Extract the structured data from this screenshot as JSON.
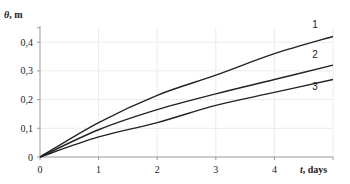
{
  "chart_data": {
    "type": "line",
    "title": "",
    "xlabel": "t, days",
    "ylabel": "θ, m",
    "xlim": [
      0,
      5
    ],
    "ylim": [
      0,
      0.45
    ],
    "grid": true,
    "legend": "inline numeric labels at curve ends",
    "x_ticks": [
      "0",
      "1",
      "2",
      "3",
      "4"
    ],
    "y_ticks": [
      "0",
      "0,1",
      "0,2",
      "0,3",
      "0,4"
    ],
    "x": [
      0,
      1,
      2,
      3,
      4,
      5
    ],
    "series": [
      {
        "name": "1",
        "values": [
          0,
          0.12,
          0.215,
          0.285,
          0.36,
          0.42
        ]
      },
      {
        "name": "2",
        "values": [
          0,
          0.095,
          0.165,
          0.22,
          0.27,
          0.32
        ]
      },
      {
        "name": "3",
        "values": [
          0,
          0.07,
          0.12,
          0.18,
          0.225,
          0.27
        ]
      }
    ]
  },
  "labels": {
    "y_axis_symbol": "θ",
    "y_axis_unit": ", m",
    "x_axis_symbol": "t",
    "x_axis_unit": ", days"
  },
  "colors": {
    "curve": "#222222",
    "axis": "#999999",
    "grid": "#ececec"
  }
}
